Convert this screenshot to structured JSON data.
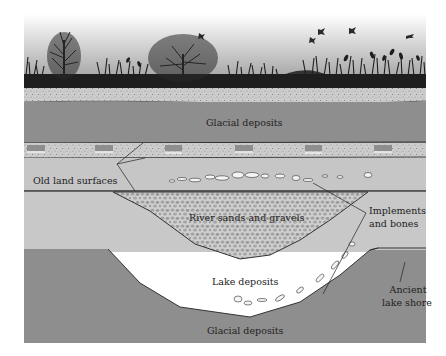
{
  "diagram": {
    "type": "geological cross-section",
    "scene": {
      "sky": "gradient-grey",
      "vegetation": [
        "trees",
        "grasses",
        "reeds"
      ],
      "birds": 5
    },
    "layers": [
      {
        "name": "topsoil",
        "pattern": "speckled"
      },
      {
        "name": "glacial_upper",
        "label": "Glacial deposits"
      },
      {
        "name": "old_land_surface_band",
        "pattern": "alternating speckled blocks"
      },
      {
        "name": "light_layer"
      },
      {
        "name": "river_channel",
        "label": "River sands and gravels",
        "pattern": "gravel"
      },
      {
        "name": "lake_basin",
        "label": "Lake deposits"
      },
      {
        "name": "glacial_lower",
        "label": "Glacial deposits"
      }
    ],
    "labels": {
      "glacial_upper": "Glacial deposits",
      "old_land_surfaces": "Old land surfaces",
      "river": "River sands and gravels",
      "implements_line1": "Implements",
      "implements_line2": "and bones",
      "lake": "Lake deposits",
      "shore_line1": "Ancient",
      "shore_line2": "lake shore",
      "glacial_lower": "Glacial deposits"
    },
    "colors": {
      "sky_top": "#ffffff",
      "sky_bottom": "#9a9a9a",
      "vegetation": "#1e1e1e",
      "topsoil": "#c8c8c8",
      "glacial": "#8e8e8e",
      "light_layer": "#c6c6c6",
      "band": "#d0d0d0",
      "gravel_bg": "#cfcfcf",
      "gravel_stone": "#9c9c9c",
      "lake": "#cbcbcb",
      "line": "#333333",
      "bones": "#f4f4f4"
    }
  }
}
